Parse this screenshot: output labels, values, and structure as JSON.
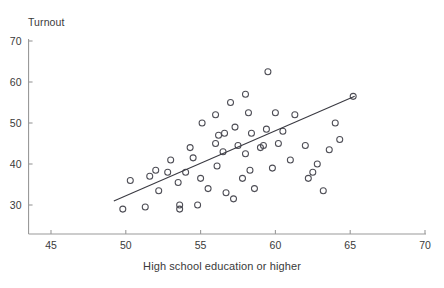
{
  "figure": {
    "clipped_caption_above": "",
    "y_axis_title": "Turnout",
    "x_axis_title": "High school education or higher"
  },
  "chart_data": {
    "type": "scatter",
    "title": "",
    "xlabel": "High school education or higher",
    "ylabel": "Turnout",
    "xlim": [
      43,
      70
    ],
    "ylim": [
      24,
      70
    ],
    "xticks": [
      45,
      50,
      55,
      60,
      65,
      70
    ],
    "yticks": [
      30,
      40,
      50,
      60,
      70
    ],
    "grid": false,
    "legend": "none",
    "marker": "open-circle",
    "marker_color": "#4d4d55",
    "series": [
      {
        "name": "States",
        "points": [
          [
            49.8,
            29.0
          ],
          [
            51.3,
            29.5
          ],
          [
            50.3,
            36.0
          ],
          [
            51.6,
            37.0
          ],
          [
            52.0,
            38.5
          ],
          [
            52.2,
            33.5
          ],
          [
            53.5,
            35.5
          ],
          [
            54.0,
            38.0
          ],
          [
            53.6,
            30.0
          ],
          [
            53.6,
            29.0
          ],
          [
            54.8,
            30.0
          ],
          [
            54.3,
            44.0
          ],
          [
            55.0,
            36.5
          ],
          [
            55.1,
            50.0
          ],
          [
            56.0,
            45.0
          ],
          [
            56.2,
            47.0
          ],
          [
            56.6,
            47.5
          ],
          [
            56.0,
            52.0
          ],
          [
            56.1,
            39.5
          ],
          [
            55.5,
            34.0
          ],
          [
            56.5,
            43.0
          ],
          [
            56.7,
            33.0
          ],
          [
            57.0,
            55.0
          ],
          [
            57.3,
            49.0
          ],
          [
            57.5,
            44.5
          ],
          [
            57.2,
            31.5
          ],
          [
            58.0,
            57.0
          ],
          [
            58.2,
            52.5
          ],
          [
            58.4,
            47.5
          ],
          [
            58.0,
            42.5
          ],
          [
            58.3,
            38.5
          ],
          [
            58.6,
            34.0
          ],
          [
            59.0,
            44.0
          ],
          [
            59.2,
            44.5
          ],
          [
            59.4,
            48.5
          ],
          [
            59.5,
            62.5
          ],
          [
            59.8,
            39.0
          ],
          [
            60.2,
            45.0
          ],
          [
            60.5,
            48.0
          ],
          [
            61.0,
            41.0
          ],
          [
            61.3,
            52.0
          ],
          [
            62.0,
            44.5
          ],
          [
            62.2,
            36.5
          ],
          [
            62.5,
            38.0
          ],
          [
            62.8,
            40.0
          ],
          [
            63.2,
            33.5
          ],
          [
            63.6,
            43.5
          ],
          [
            64.0,
            50.0
          ],
          [
            64.3,
            46.0
          ],
          [
            65.2,
            56.5
          ],
          [
            53.0,
            41.0
          ],
          [
            54.5,
            41.5
          ],
          [
            52.8,
            38.0
          ],
          [
            57.8,
            36.5
          ],
          [
            60.0,
            52.5
          ]
        ]
      }
    ],
    "fit_line": {
      "name": "regression-line",
      "x_start": 49.2,
      "y_start": 31.0,
      "x_end": 65.3,
      "y_end": 56.5
    }
  }
}
